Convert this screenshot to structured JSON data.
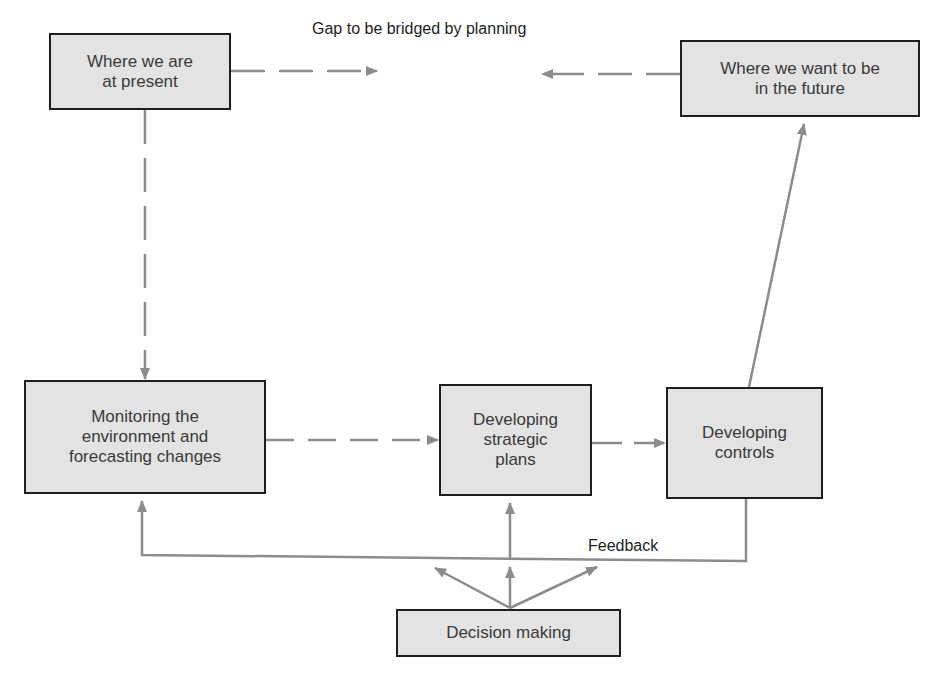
{
  "diagram": {
    "title_label": "Gap to be bridged by planning",
    "feedback_label": "Feedback",
    "nodes": {
      "present": "Where we are\nat present",
      "future": "Where we want to be\nin the future",
      "monitoring": "Monitoring the\nenvironment and\nforecasting changes",
      "strategic": "Developing\nstrategic\nplans",
      "controls": "Developing\ncontrols",
      "decision": "Decision making"
    },
    "edges": [
      {
        "from": "present",
        "to": "gap",
        "style": "dashed"
      },
      {
        "from": "future",
        "to": "gap",
        "style": "dashed"
      },
      {
        "from": "present",
        "to": "monitoring",
        "style": "dashed"
      },
      {
        "from": "monitoring",
        "to": "strategic",
        "style": "dashed"
      },
      {
        "from": "strategic",
        "to": "controls",
        "style": "dashed"
      },
      {
        "from": "controls",
        "to": "future",
        "style": "solid"
      },
      {
        "from": "controls",
        "to": "monitoring",
        "style": "solid",
        "label": "Feedback"
      },
      {
        "from": "feedback-line",
        "to": "strategic",
        "style": "solid"
      },
      {
        "from": "decision",
        "to": "feedback-line",
        "style": "solid",
        "count": 3
      }
    ],
    "colors": {
      "box_fill": "#e3e3e3",
      "box_border": "#1e1e1e",
      "arrow": "#8c8c8c",
      "text": "#3a3a3a"
    }
  }
}
